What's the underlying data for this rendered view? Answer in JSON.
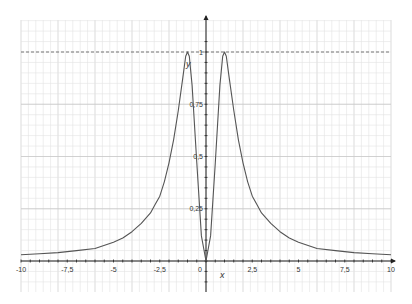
{
  "chart_data": {
    "type": "line",
    "title": "",
    "xlabel": "x",
    "ylabel": "y",
    "xlim": [
      -10,
      10
    ],
    "ylim": [
      -0.15,
      1.15
    ],
    "grid": true,
    "x_ticks": [
      "-10",
      "-7,5",
      "-5",
      "-2,5",
      "0",
      "2,5",
      "5",
      "7,5",
      "10"
    ],
    "y_ticks": [
      "0,25",
      "0,5",
      "0,75",
      "1"
    ],
    "origin_label": "0",
    "asymptote": {
      "y": 1,
      "style": "dashed"
    },
    "series": [
      {
        "name": "f(x)",
        "x": [
          -10,
          -9,
          -8,
          -7,
          -6,
          -5,
          -4.5,
          -4,
          -3.5,
          -3,
          -2.75,
          -2.5,
          -2.25,
          -2,
          -1.75,
          -1.5,
          -1.25,
          -1.1,
          -1,
          -0.9,
          -0.75,
          -0.5,
          -0.25,
          0,
          0.25,
          0.5,
          0.75,
          0.9,
          1,
          1.1,
          1.25,
          1.5,
          1.75,
          2,
          2.25,
          2.5,
          2.75,
          3,
          3.5,
          4,
          4.5,
          5,
          6,
          7,
          8,
          9,
          10
        ],
        "values": [
          0.03,
          0.035,
          0.04,
          0.05,
          0.06,
          0.09,
          0.11,
          0.14,
          0.18,
          0.23,
          0.27,
          0.31,
          0.38,
          0.47,
          0.58,
          0.72,
          0.88,
          0.98,
          1.0,
          0.98,
          0.84,
          0.47,
          0.12,
          0.0,
          0.12,
          0.47,
          0.84,
          0.98,
          1.0,
          0.98,
          0.88,
          0.72,
          0.58,
          0.47,
          0.38,
          0.31,
          0.27,
          0.23,
          0.18,
          0.14,
          0.11,
          0.09,
          0.06,
          0.05,
          0.04,
          0.035,
          0.03
        ]
      }
    ]
  },
  "colors": {
    "curve": "#555555",
    "axis": "#222222",
    "grid_minor": "#e2e2e2",
    "grid_major": "#c4c4c4",
    "asymptote": "#666666"
  }
}
